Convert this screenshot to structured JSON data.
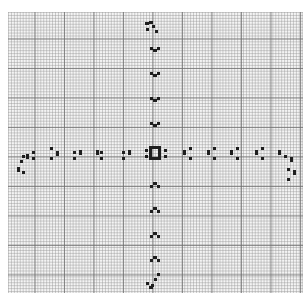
{
  "diagram": {
    "type": "graph-paper-pixel-pattern",
    "colors": {
      "background": "#ffffff",
      "paper": "#f4f4f4",
      "grid_major": "#6e6e6e",
      "grid_minor": "#969696",
      "ink": "#1e1e1e"
    },
    "center_glyph": "box-with-side-dots",
    "arms": {
      "up": [
        "hook-top",
        "cup",
        "cup",
        "cup",
        "cup",
        "cup"
      ],
      "down": [
        "cap",
        "cap",
        "cap",
        "cap",
        "cap",
        "hook-bottom"
      ],
      "left": [
        "hook-left",
        "colon-bar",
        "colon-bar",
        "colon-bar",
        "colon-bar",
        "colon-bar"
      ],
      "right": [
        "bar-colon",
        "bar-colon",
        "bar-colon",
        "bar-colon",
        "bar-colon",
        "hook-right"
      ]
    },
    "marks": [
      [
        145,
        22,
        4,
        3
      ],
      [
        149,
        21,
        4,
        3
      ],
      [
        152,
        25,
        3,
        3
      ],
      [
        146,
        28,
        3,
        3
      ],
      [
        155,
        30,
        3,
        3
      ],
      [
        150,
        47,
        3,
        3
      ],
      [
        153,
        49,
        4,
        3
      ],
      [
        157,
        47,
        3,
        3
      ],
      [
        150,
        72,
        3,
        3
      ],
      [
        153,
        74,
        4,
        3
      ],
      [
        157,
        72,
        3,
        3
      ],
      [
        150,
        97,
        3,
        3
      ],
      [
        153,
        99,
        4,
        3
      ],
      [
        157,
        97,
        3,
        3
      ],
      [
        150,
        122,
        3,
        3
      ],
      [
        153,
        124,
        4,
        3
      ],
      [
        157,
        122,
        3,
        3
      ],
      [
        145,
        149,
        3,
        3
      ],
      [
        145,
        155,
        3,
        3
      ],
      [
        149,
        146,
        3,
        14
      ],
      [
        158,
        146,
        3,
        14
      ],
      [
        152,
        146,
        6,
        3
      ],
      [
        152,
        157,
        6,
        3
      ],
      [
        164,
        149,
        3,
        3
      ],
      [
        164,
        155,
        3,
        3
      ],
      [
        150,
        185,
        3,
        3
      ],
      [
        153,
        182,
        4,
        3
      ],
      [
        157,
        185,
        3,
        3
      ],
      [
        150,
        210,
        3,
        3
      ],
      [
        153,
        207,
        4,
        3
      ],
      [
        157,
        210,
        3,
        3
      ],
      [
        150,
        235,
        3,
        3
      ],
      [
        153,
        232,
        4,
        3
      ],
      [
        157,
        235,
        3,
        3
      ],
      [
        150,
        259,
        3,
        3
      ],
      [
        153,
        256,
        4,
        3
      ],
      [
        157,
        259,
        3,
        3
      ],
      [
        157,
        273,
        3,
        3
      ],
      [
        154,
        278,
        3,
        3
      ],
      [
        151,
        284,
        3,
        3
      ],
      [
        146,
        282,
        3,
        3
      ],
      [
        149,
        286,
        4,
        3
      ],
      [
        32,
        151,
        3,
        3
      ],
      [
        32,
        157,
        3,
        3
      ],
      [
        26,
        154,
        3,
        5
      ],
      [
        22,
        155,
        3,
        3
      ],
      [
        20,
        160,
        3,
        3
      ],
      [
        17,
        167,
        3,
        5
      ],
      [
        22,
        171,
        3,
        3
      ],
      [
        50,
        147,
        3,
        3
      ],
      [
        50,
        157,
        3,
        3
      ],
      [
        56,
        151,
        3,
        5
      ],
      [
        73,
        151,
        3,
        3
      ],
      [
        73,
        157,
        3,
        3
      ],
      [
        79,
        150,
        3,
        5
      ],
      [
        100,
        151,
        3,
        3
      ],
      [
        100,
        157,
        3,
        3
      ],
      [
        96,
        150,
        3,
        5
      ],
      [
        122,
        151,
        3,
        3
      ],
      [
        122,
        157,
        3,
        3
      ],
      [
        128,
        150,
        3,
        5
      ],
      [
        183,
        150,
        3,
        5
      ],
      [
        189,
        147,
        3,
        3
      ],
      [
        189,
        157,
        3,
        3
      ],
      [
        207,
        150,
        3,
        5
      ],
      [
        213,
        147,
        3,
        3
      ],
      [
        213,
        157,
        3,
        3
      ],
      [
        230,
        150,
        3,
        5
      ],
      [
        236,
        147,
        3,
        3
      ],
      [
        236,
        157,
        3,
        3
      ],
      [
        255,
        150,
        3,
        5
      ],
      [
        261,
        147,
        3,
        3
      ],
      [
        261,
        157,
        3,
        3
      ],
      [
        278,
        150,
        3,
        5
      ],
      [
        284,
        155,
        3,
        3
      ],
      [
        290,
        157,
        3,
        5
      ],
      [
        287,
        168,
        3,
        3
      ],
      [
        293,
        170,
        3,
        5
      ],
      [
        287,
        178,
        3,
        3
      ]
    ]
  }
}
